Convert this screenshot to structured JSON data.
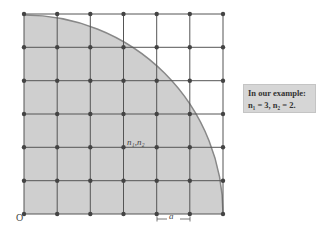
{
  "diagram": {
    "grid": {
      "cells_x": 6,
      "cells_y": 6,
      "left": 24,
      "top": 14,
      "right": 223,
      "bottom": 214
    },
    "colors": {
      "fill": "#cfcfcf",
      "grid_line": "#555555",
      "dot": "#444444",
      "arc": "#888888"
    },
    "origin_label": "O",
    "point_label": "n₁,n₂",
    "spacing_label": "a"
  },
  "note": {
    "title": "In our example:",
    "values": "n₁ = 3, n₂ = 2."
  }
}
